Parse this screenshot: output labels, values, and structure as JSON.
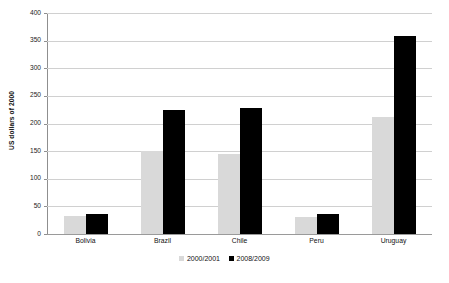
{
  "chart_data": {
    "type": "bar",
    "title": "",
    "xlabel": "",
    "ylabel": "US dollars of 2000",
    "ylim": [
      0,
      400
    ],
    "ytick_step": 50,
    "yticks": [
      400,
      350,
      300,
      250,
      200,
      150,
      100,
      50,
      0
    ],
    "grid": true,
    "legend_position": "bottom",
    "categories": [
      "Bolivia",
      "Brazil",
      "Chile",
      "Peru",
      "Uruguay"
    ],
    "series": [
      {
        "name": "2000/2001",
        "color": "#d9d9d9",
        "values": [
          32,
          151,
          145,
          30,
          212
        ]
      },
      {
        "name": "2008/2009",
        "color": "#000000",
        "values": [
          36,
          224,
          228,
          36,
          359
        ]
      }
    ]
  },
  "axes": {
    "y_title": "US dollars of 2000"
  },
  "colors": {
    "series_2000_2001": "#d9d9d9",
    "series_2008_2009": "#000000",
    "gridline": "#d0d0d0",
    "axis": "#8f8f8f",
    "background": "#ffffff"
  }
}
